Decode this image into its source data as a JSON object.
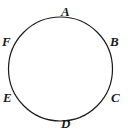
{
  "figure": {
    "type": "geometry-diagram",
    "background_color": "#ffffff",
    "shape": {
      "name": "circle",
      "stroke_color": "#1a1a1a",
      "stroke_width": 1.2,
      "fill": "none",
      "center_x": 60.5,
      "center_y": 69,
      "radius": 52
    },
    "labels": [
      {
        "id": "A",
        "text": "A",
        "position": "top",
        "angle_deg": 90
      },
      {
        "id": "B",
        "text": "B",
        "position": "upper-right",
        "angle_deg": 30
      },
      {
        "id": "C",
        "text": "C",
        "position": "lower-right",
        "angle_deg": -30
      },
      {
        "id": "D",
        "text": "D",
        "position": "bottom",
        "angle_deg": -90
      },
      {
        "id": "E",
        "text": "E",
        "position": "lower-left",
        "angle_deg": 210
      },
      {
        "id": "F",
        "text": "F",
        "position": "upper-left",
        "angle_deg": 150
      }
    ]
  }
}
